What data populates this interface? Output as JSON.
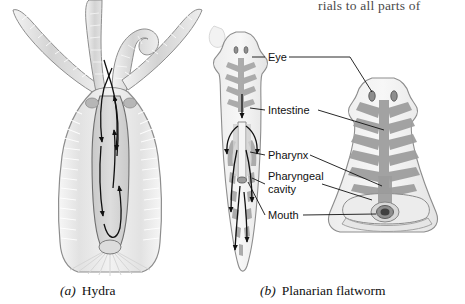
{
  "figure": {
    "cut_off_text_top": "rials to all parts of",
    "background_color": "#ffffff",
    "ink_color": "#111111",
    "panels": [
      {
        "id": "a",
        "letter": "(a)",
        "name": "Hydra",
        "organism_icon": "hydra-icon",
        "description_parts": [
          "tentacles",
          "gastrovascular-cavity",
          "body-wall",
          "basal-disc"
        ],
        "arrow_count": 6
      },
      {
        "id": "b",
        "letter": "(b)",
        "name": "Planarian flatworm",
        "organism_icon": "planarian-icon",
        "description_parts": [
          "head",
          "branching-intestine",
          "pharynx",
          "mouth"
        ],
        "arrow_count": 7
      }
    ],
    "callouts": [
      {
        "id": "eye",
        "label": "Eye",
        "icon": "eye-label",
        "x": 268,
        "y": 51
      },
      {
        "id": "intestine",
        "label": "Intestine",
        "icon": "intestine-label",
        "x": 268,
        "y": 104
      },
      {
        "id": "pharynx",
        "label": "Pharynx",
        "icon": "pharynx-label",
        "x": 268,
        "y": 149
      },
      {
        "id": "pharyngeal-cavity",
        "label": "Pharyngeal\ncavity",
        "icon": "pharyngeal-cavity-label",
        "x": 268,
        "y": 170
      },
      {
        "id": "mouth",
        "label": "Mouth",
        "icon": "mouth-label",
        "x": 268,
        "y": 209
      }
    ],
    "captions": [
      {
        "id": "a",
        "letter": "(a)",
        "text": "Hydra",
        "x": 60,
        "y": 283
      },
      {
        "id": "b",
        "letter": "(b)",
        "text": "Planarian flatworm",
        "x": 260,
        "y": 283
      }
    ],
    "colors": {
      "outline": "#8d8d8d",
      "tissue_light": "#e8e8e8",
      "tissue_mid": "#c2c2c2",
      "tissue_dark": "#9a9a9a",
      "cavity": "#d4d4d4",
      "leader": "#111111"
    }
  }
}
